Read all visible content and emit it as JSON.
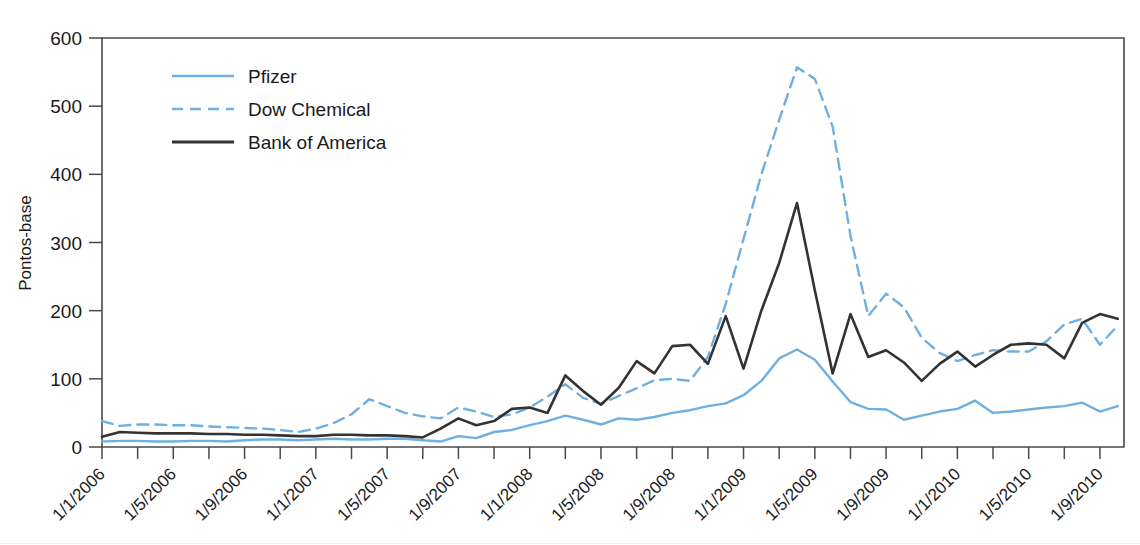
{
  "chart_data": {
    "type": "line",
    "title": "",
    "subtitle": "",
    "xlabel": "",
    "ylabel": "Pontos-base",
    "ylim": [
      0,
      600
    ],
    "yticks": [
      0,
      100,
      200,
      300,
      400,
      500,
      600
    ],
    "ytick_labels": [
      "0",
      "100",
      "200",
      "300",
      "400",
      "500",
      "600"
    ],
    "grid": false,
    "legend_position": "top-left-inside",
    "x_tick_interval_months": 2,
    "x_label_interval_months": 4,
    "x_labeled_ticks": [
      "1/1/2006",
      "1/5/2006",
      "1/9/2006",
      "1/1/2007",
      "1/5/2007",
      "1/9/2007",
      "1/1/2008",
      "1/5/2008",
      "1/9/2008",
      "1/1/2009",
      "1/5/2009",
      "1/9/2009",
      "1/1/2010",
      "1/5/2010",
      "1/9/2010"
    ],
    "x": [
      "1/1/2006",
      "1/2/2006",
      "1/3/2006",
      "1/4/2006",
      "1/5/2006",
      "1/6/2006",
      "1/7/2006",
      "1/8/2006",
      "1/9/2006",
      "1/10/2006",
      "1/11/2006",
      "1/12/2006",
      "1/1/2007",
      "1/2/2007",
      "1/3/2007",
      "1/4/2007",
      "1/5/2007",
      "1/6/2007",
      "1/7/2007",
      "1/8/2007",
      "1/9/2007",
      "1/10/2007",
      "1/11/2007",
      "1/12/2007",
      "1/1/2008",
      "1/2/2008",
      "1/3/2008",
      "1/4/2008",
      "1/5/2008",
      "1/6/2008",
      "1/7/2008",
      "1/8/2008",
      "1/9/2008",
      "1/10/2008",
      "1/11/2008",
      "1/12/2008",
      "1/1/2009",
      "1/2/2009",
      "1/3/2009",
      "1/4/2009",
      "1/5/2009",
      "1/6/2009",
      "1/7/2009",
      "1/8/2009",
      "1/9/2009",
      "1/10/2009",
      "1/11/2009",
      "1/12/2009",
      "1/1/2010",
      "1/2/2010",
      "1/3/2010",
      "1/4/2010",
      "1/5/2010",
      "1/6/2010",
      "1/7/2010",
      "1/8/2010",
      "1/9/2010",
      "1/10/2010"
    ],
    "series": [
      {
        "name": "Pfizer",
        "color": "#70b0e0",
        "style": "solid",
        "values": [
          8,
          9,
          9,
          8,
          8,
          9,
          9,
          8,
          10,
          11,
          11,
          10,
          11,
          12,
          11,
          11,
          12,
          12,
          10,
          8,
          16,
          13,
          22,
          25,
          32,
          38,
          46,
          40,
          33,
          42,
          40,
          44,
          50,
          54,
          60,
          64,
          76,
          97,
          130,
          143,
          128,
          96,
          66,
          56,
          55,
          40,
          46,
          52,
          56,
          68,
          50,
          52,
          55,
          58,
          60,
          65,
          52,
          60
        ]
      },
      {
        "name": "Dow Chemical",
        "color": "#70b0e0",
        "style": "dashed",
        "values": [
          38,
          31,
          33,
          33,
          32,
          32,
          30,
          29,
          28,
          27,
          25,
          22,
          27,
          35,
          48,
          70,
          60,
          50,
          45,
          42,
          58,
          52,
          44,
          48,
          58,
          74,
          92,
          72,
          63,
          75,
          86,
          98,
          100,
          97,
          132,
          210,
          305,
          400,
          480,
          557,
          540,
          470,
          310,
          192,
          225,
          205,
          160,
          138,
          126,
          135,
          142,
          140,
          140,
          155,
          180,
          188,
          150,
          178
        ]
      },
      {
        "name": "Bank of America",
        "color": "#333333",
        "style": "solid",
        "values": [
          15,
          22,
          21,
          20,
          20,
          20,
          19,
          19,
          18,
          18,
          17,
          16,
          16,
          18,
          18,
          17,
          17,
          16,
          14,
          27,
          42,
          32,
          38,
          56,
          58,
          50,
          105,
          82,
          62,
          87,
          126,
          108,
          148,
          150,
          122,
          192,
          115,
          200,
          270,
          358,
          230,
          108,
          195,
          132,
          142,
          124,
          97,
          122,
          140,
          118,
          135,
          150,
          152,
          150,
          130,
          182,
          195,
          188
        ]
      }
    ],
    "annotations": []
  },
  "legend": {
    "items": [
      {
        "label": "Pfizer"
      },
      {
        "label": "Dow Chemical"
      },
      {
        "label": "Bank of America"
      }
    ]
  },
  "colors": {
    "pfizer": "#70b0e0",
    "dow_chemical": "#70b0e0",
    "bank_of_america": "#333333",
    "axis": "#4a4a4a",
    "background": "#ffffff"
  }
}
